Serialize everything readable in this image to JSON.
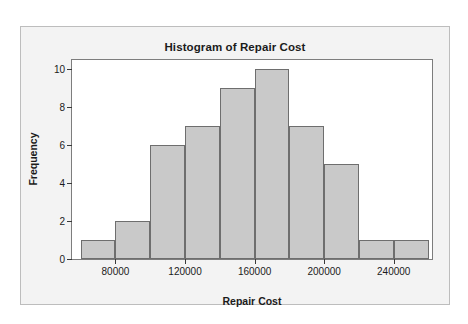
{
  "figure": {
    "title": "Histogram of Repair Cost",
    "background_color": "#f3f3f3",
    "plot_background_color": "#ffffff",
    "border_color": "#bdbdbd"
  },
  "chart_data": {
    "type": "bar",
    "subtype": "histogram",
    "title": "Histogram of Repair Cost",
    "xlabel": "Repair Cost",
    "ylabel": "Frequency",
    "bar_fill_color": "#c9c9c9",
    "bar_edge_color": "#6e6e6e",
    "grid": false,
    "legend": false,
    "bin_width": 20000,
    "bin_edges": [
      60000,
      80000,
      100000,
      120000,
      140000,
      160000,
      180000,
      200000,
      220000,
      240000,
      260000
    ],
    "bin_centers": [
      70000,
      90000,
      110000,
      130000,
      150000,
      170000,
      190000,
      210000,
      230000,
      250000
    ],
    "values": [
      1,
      2,
      6,
      7,
      9,
      10,
      7,
      5,
      1,
      1
    ],
    "categories": [
      "60000-80000",
      "80000-100000",
      "100000-120000",
      "120000-140000",
      "140000-160000",
      "160000-180000",
      "180000-200000",
      "200000-220000",
      "220000-240000",
      "240000-260000"
    ],
    "total_count": 49,
    "xlim": [
      55000,
      262000
    ],
    "ylim": [
      0,
      10.5
    ],
    "xticks": [
      80000,
      120000,
      160000,
      200000,
      240000
    ],
    "xticklabels": [
      "80000",
      "120000",
      "160000",
      "200000",
      "240000"
    ],
    "yticks": [
      0,
      2,
      4,
      6,
      8,
      10
    ],
    "yticklabels": [
      "0",
      "2",
      "4",
      "6",
      "8",
      "10"
    ]
  }
}
